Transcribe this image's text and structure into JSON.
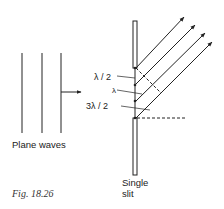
{
  "figure": {
    "caption": "Fig. 18.26",
    "plane_waves_label": "Plane waves",
    "slit_label_line1": "Single",
    "slit_label_line2": "slit",
    "path_labels": [
      "λ / 2",
      "λ",
      "3λ / 2"
    ],
    "ray_count": 4,
    "wavefront_count": 3,
    "colors": {
      "ink": "#222222",
      "background": "#ffffff"
    }
  }
}
